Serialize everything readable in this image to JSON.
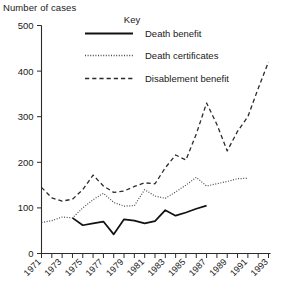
{
  "chart_data": {
    "type": "line",
    "title": "",
    "ylabel": "Number of cases",
    "xlabel": "",
    "ylim": [
      0,
      500
    ],
    "yticks": [
      0,
      100,
      200,
      300,
      400,
      500
    ],
    "xlim": [
      1971,
      1993
    ],
    "xticks": [
      1971,
      1972,
      1973,
      1974,
      1975,
      1976,
      1977,
      1978,
      1979,
      1980,
      1981,
      1982,
      1983,
      1984,
      1985,
      1986,
      1987,
      1988,
      1989,
      1990,
      1991,
      1992,
      1993
    ],
    "xtick_labels": [
      "1971",
      "",
      "1973",
      "",
      "1975",
      "",
      "1977",
      "",
      "1979",
      "",
      "1981",
      "",
      "1983",
      "",
      "1985",
      "",
      "1987",
      "",
      "1989",
      "",
      "1991",
      "",
      "1993"
    ],
    "grid": false,
    "legend_position": "upper-center",
    "legend_title": "Key",
    "series": [
      {
        "name": "Death benefit",
        "style": "solid",
        "x": [
          1974,
          1975,
          1976,
          1977,
          1978,
          1979,
          1980,
          1981,
          1982,
          1983,
          1984,
          1985,
          1986,
          1987
        ],
        "values": [
          78,
          62,
          66,
          70,
          42,
          75,
          72,
          66,
          71,
          95,
          83,
          90,
          98,
          105
        ]
      },
      {
        "name": "Death certificates",
        "style": "dotted",
        "x": [
          1971,
          1972,
          1973,
          1974,
          1975,
          1976,
          1977,
          1978,
          1979,
          1980,
          1981,
          1982,
          1983,
          1984,
          1985,
          1986,
          1987,
          1988,
          1989,
          1990,
          1991
        ],
        "values": [
          68,
          72,
          80,
          78,
          100,
          118,
          132,
          112,
          104,
          105,
          140,
          126,
          121,
          135,
          150,
          167,
          148,
          153,
          158,
          164,
          165
        ]
      },
      {
        "name": "Disablement benefit",
        "style": "dashed",
        "x": [
          1971,
          1972,
          1973,
          1974,
          1975,
          1976,
          1977,
          1978,
          1979,
          1980,
          1981,
          1982,
          1983,
          1984,
          1985,
          1986,
          1987,
          1988,
          1989,
          1990,
          1991,
          1992,
          1993
        ],
        "values": [
          145,
          122,
          115,
          119,
          140,
          172,
          148,
          134,
          137,
          147,
          155,
          153,
          188,
          216,
          205,
          262,
          330,
          283,
          225,
          268,
          300,
          362,
          420
        ]
      }
    ]
  },
  "legend": {
    "title": "Key",
    "entries": [
      {
        "label": "Death benefit",
        "style": "solid"
      },
      {
        "label": "Death certificates",
        "style": "dotted"
      },
      {
        "label": "Disablement benefit",
        "style": "dashed"
      }
    ]
  },
  "axes": {
    "y_title": "Number of cases"
  }
}
